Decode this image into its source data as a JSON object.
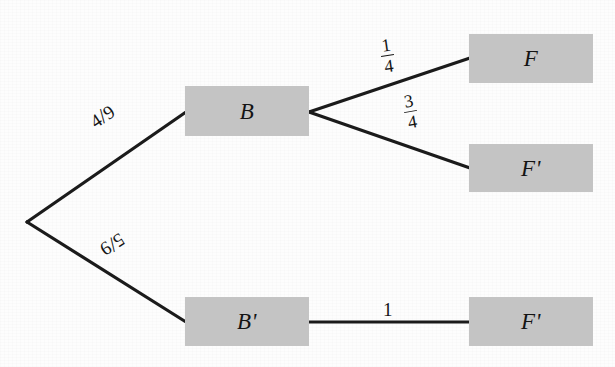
{
  "diagram": {
    "type": "probability-tree",
    "title": "",
    "background_color": "#fdfdfd",
    "node_fill_color": "#c4c4c4",
    "edge_color": "#1b1b1b",
    "text_color": "#141414",
    "root": {
      "name": "root",
      "label": ""
    },
    "nodes": [
      {
        "id": "B",
        "label": "B",
        "level": 1,
        "position": "upper"
      },
      {
        "id": "Bp",
        "label": "B'",
        "level": 1,
        "position": "lower"
      },
      {
        "id": "F",
        "label": "F",
        "level": 2,
        "position": "upper"
      },
      {
        "id": "Fp1",
        "label": "F'",
        "level": 2,
        "position": "middle"
      },
      {
        "id": "Fp2",
        "label": "F'",
        "level": 2,
        "position": "lower"
      }
    ],
    "edges": [
      {
        "id": "root-B",
        "from": "root",
        "to": "B",
        "label": "4/9",
        "numerator": "4",
        "denominator": "9",
        "style": "slash",
        "value": 0.4444
      },
      {
        "id": "root-Bp",
        "from": "root",
        "to": "Bp",
        "label": "5/9",
        "numerator": "5",
        "denominator": "9",
        "style": "slash",
        "value": 0.5556
      },
      {
        "id": "B-F",
        "from": "B",
        "to": "F",
        "label": "1/4",
        "numerator": "1",
        "denominator": "4",
        "style": "stacked",
        "value": 0.25
      },
      {
        "id": "B-Fp",
        "from": "B",
        "to": "Fp1",
        "label": "3/4",
        "numerator": "3",
        "denominator": "4",
        "style": "stacked",
        "value": 0.75
      },
      {
        "id": "Bp-Fp",
        "from": "Bp",
        "to": "Fp2",
        "label": "1",
        "numerator": "1",
        "denominator": "",
        "style": "plain",
        "value": 1
      }
    ]
  }
}
